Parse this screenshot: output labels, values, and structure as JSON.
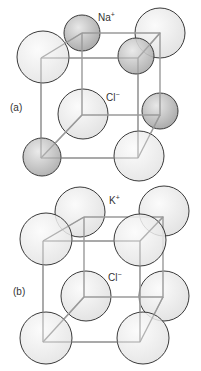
{
  "panels": [
    {
      "id": "a",
      "label": "(a)",
      "cation_label": "Na",
      "cation_charge": "+",
      "anion_label": "Cl",
      "anion_charge": "−"
    },
    {
      "id": "b",
      "label": "(b)",
      "cation_label": "K",
      "cation_charge": "+",
      "anion_label": "Cl",
      "anion_charge": "−"
    }
  ],
  "colors": {
    "cube_edge": "#9a9a9a",
    "sphere_outline": "#3a3a3a",
    "anion_fill": "#ececec",
    "cation_fill": "#c8c8c8"
  }
}
